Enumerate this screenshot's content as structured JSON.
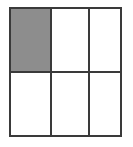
{
  "figure": {
    "name": "shaded-fraction-grid",
    "rows": 2,
    "columns": 3,
    "total_cells": 6,
    "shaded_cells": 1,
    "unshaded_cells": 5,
    "fraction_shaded": "1/6",
    "canvas_width": 133,
    "canvas_height": 147
  },
  "colors": {
    "background": "#ffffff",
    "line": "#3a3a3a",
    "shaded_fill": "#8d8d8d",
    "unshaded_fill": "#ffffff"
  },
  "grid": {
    "outer_border_width": 2,
    "divider_width": 2,
    "cells": [
      {
        "id": "cell-r0-c0",
        "row": 0,
        "column": 0,
        "state": "shaded",
        "label": ""
      },
      {
        "id": "cell-r0-c1",
        "row": 0,
        "column": 1,
        "state": "unshaded",
        "label": ""
      },
      {
        "id": "cell-r0-c2",
        "row": 0,
        "column": 2,
        "state": "unshaded",
        "label": ""
      },
      {
        "id": "cell-r1-c0",
        "row": 1,
        "column": 0,
        "state": "unshaded",
        "label": ""
      },
      {
        "id": "cell-r1-c1",
        "row": 1,
        "column": 1,
        "state": "unshaded",
        "label": ""
      },
      {
        "id": "cell-r1-c2",
        "row": 1,
        "column": 2,
        "state": "unshaded",
        "label": ""
      }
    ],
    "vertical_dividers": [
      {
        "id": "v-divider-1",
        "index": 1
      },
      {
        "id": "v-divider-2",
        "index": 2
      }
    ],
    "horizontal_dividers": [
      {
        "id": "h-divider-1",
        "index": 1
      }
    ]
  }
}
